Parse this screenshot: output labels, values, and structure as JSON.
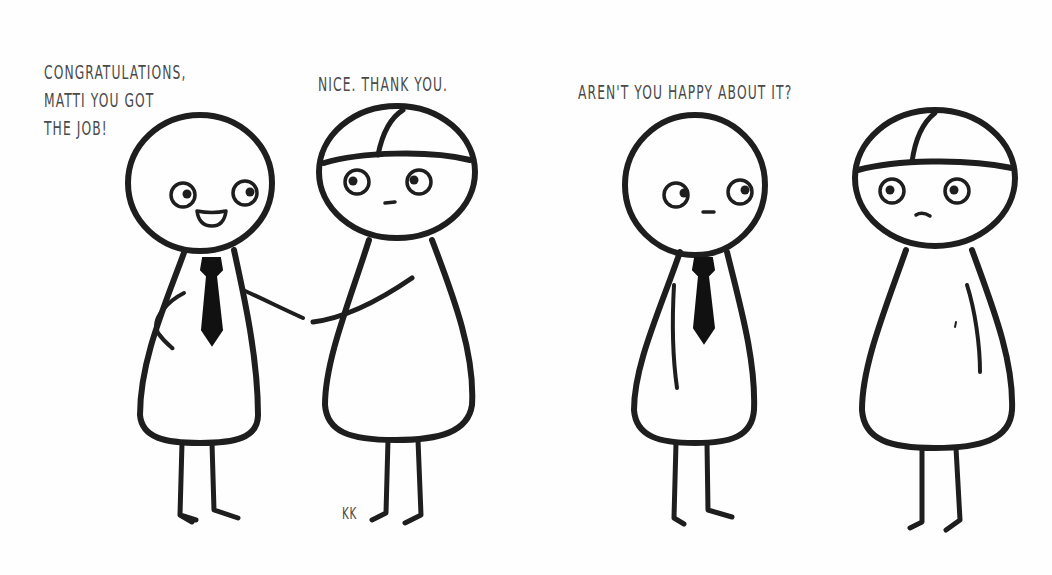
{
  "comic": {
    "panels": [
      {
        "index": 1,
        "captions": [
          {
            "speaker": "character-with-tie",
            "text": "CONGRATULATIONS,\nMATTI YOU GOT\nTHE JOB!"
          },
          {
            "speaker": "matti",
            "text": "NICE. THANK YOU."
          }
        ],
        "action": "handshake",
        "signature": "KK"
      },
      {
        "index": 2,
        "captions": [
          {
            "speaker": "character-with-tie",
            "text": "AREN'T YOU HAPPY ABOUT IT?"
          }
        ],
        "action": "standing-silent"
      }
    ],
    "characters": {
      "tie_character": {
        "accessory": "black-tie",
        "expression_panel_1": "smiling",
        "expression_panel_2": "neutral"
      },
      "matti": {
        "accessory": "cap-line-head",
        "expression_panel_1": "neutral",
        "expression_panel_2": "slight-frown"
      }
    },
    "colors": {
      "background": "#fefefe",
      "ink": "#1e1e1e",
      "text": "#4a4a4a"
    }
  }
}
